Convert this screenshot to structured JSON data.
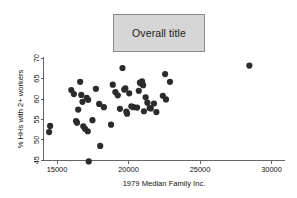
{
  "figure": {
    "title": "Overall title",
    "background_color": "#ffffff",
    "title_box_fill": "#d6d6d6",
    "title_box_border": "#8a8a8a",
    "point_color": "#2b2b2b",
    "axis_color": "#555555"
  },
  "chart_data": {
    "type": "scatter",
    "title": "Overall title",
    "xlabel": "1979 Median Family Inc.",
    "ylabel": "% HHs with 2+ workers",
    "xlim": [
      13600,
      30700
    ],
    "ylim": [
      43.5,
      71.5
    ],
    "xticks": [
      15000,
      20000,
      25000,
      30000
    ],
    "yticks": [
      45,
      50,
      55,
      60,
      65,
      70
    ],
    "xtick_labels": [
      "15000",
      "20000",
      "25000",
      "30000"
    ],
    "ytick_labels": [
      "45",
      "50",
      "55",
      "60",
      "65",
      "70"
    ],
    "grid": false,
    "legend": false,
    "marker": "filled-circle",
    "marker_size": 3.1,
    "n_points": 52,
    "points": [
      {
        "x": 14450,
        "y": 51.9
      },
      {
        "x": 14520,
        "y": 53.4
      },
      {
        "x": 16000,
        "y": 62.2
      },
      {
        "x": 16180,
        "y": 61.2
      },
      {
        "x": 16330,
        "y": 54.6
      },
      {
        "x": 16400,
        "y": 54.2
      },
      {
        "x": 16480,
        "y": 57.4
      },
      {
        "x": 16620,
        "y": 64.2
      },
      {
        "x": 16700,
        "y": 61.0
      },
      {
        "x": 16780,
        "y": 59.3
      },
      {
        "x": 16840,
        "y": 53.3
      },
      {
        "x": 16960,
        "y": 52.7
      },
      {
        "x": 17080,
        "y": 60.3
      },
      {
        "x": 17150,
        "y": 52.1
      },
      {
        "x": 17180,
        "y": 59.8
      },
      {
        "x": 17220,
        "y": 44.7
      },
      {
        "x": 17480,
        "y": 54.8
      },
      {
        "x": 17720,
        "y": 62.5
      },
      {
        "x": 17950,
        "y": 58.8
      },
      {
        "x": 18020,
        "y": 48.5
      },
      {
        "x": 18280,
        "y": 58.0
      },
      {
        "x": 18780,
        "y": 53.7
      },
      {
        "x": 18900,
        "y": 63.5
      },
      {
        "x": 19080,
        "y": 61.7
      },
      {
        "x": 19250,
        "y": 60.9
      },
      {
        "x": 19400,
        "y": 57.6
      },
      {
        "x": 19580,
        "y": 67.6
      },
      {
        "x": 19700,
        "y": 62.3
      },
      {
        "x": 19780,
        "y": 62.6
      },
      {
        "x": 19850,
        "y": 56.9
      },
      {
        "x": 19900,
        "y": 56.4
      },
      {
        "x": 20050,
        "y": 61.4
      },
      {
        "x": 20200,
        "y": 58.2
      },
      {
        "x": 20350,
        "y": 58.0
      },
      {
        "x": 20600,
        "y": 57.9
      },
      {
        "x": 20720,
        "y": 62.0
      },
      {
        "x": 20800,
        "y": 64.0
      },
      {
        "x": 20880,
        "y": 63.8
      },
      {
        "x": 20950,
        "y": 64.3
      },
      {
        "x": 21020,
        "y": 63.4
      },
      {
        "x": 21080,
        "y": 57.0
      },
      {
        "x": 21200,
        "y": 60.4
      },
      {
        "x": 21320,
        "y": 59.1
      },
      {
        "x": 21480,
        "y": 57.8
      },
      {
        "x": 21560,
        "y": 57.7
      },
      {
        "x": 21780,
        "y": 58.9
      },
      {
        "x": 21950,
        "y": 56.8
      },
      {
        "x": 22400,
        "y": 60.8
      },
      {
        "x": 22560,
        "y": 66.1
      },
      {
        "x": 22620,
        "y": 59.9
      },
      {
        "x": 22900,
        "y": 64.2
      },
      {
        "x": 28450,
        "y": 68.2
      }
    ]
  },
  "axes": {
    "x_tick_label_0": "15000",
    "x_tick_label_1": "20000",
    "x_tick_label_2": "25000",
    "x_tick_label_3": "30000",
    "y_tick_label_0": "45",
    "y_tick_label_1": "50",
    "y_tick_label_2": "55",
    "y_tick_label_3": "60",
    "y_tick_label_4": "65",
    "y_tick_label_5": "70",
    "x_axis_title": "1979 Median Family Inc.",
    "y_axis_title": "% HHs with 2+ workers"
  }
}
